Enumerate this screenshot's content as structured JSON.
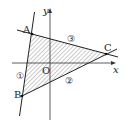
{
  "diagram": {
    "type": "coordinate-geometry",
    "axes": {
      "x_label": "x",
      "y_label": "y",
      "origin_label": "O"
    },
    "points": [
      {
        "label": "A",
        "x": 32,
        "y": 34
      },
      {
        "label": "B",
        "x": 22,
        "y": 96
      },
      {
        "label": "C",
        "x": 106,
        "y": 54
      }
    ],
    "lines": [
      {
        "label": "①",
        "through": [
          "A",
          "B"
        ]
      },
      {
        "label": "②",
        "through": [
          "B",
          "C"
        ]
      },
      {
        "label": "③",
        "through": [
          "A",
          "C"
        ]
      }
    ],
    "region": {
      "shading": "hatched",
      "vertices": [
        "A",
        "B",
        "C"
      ]
    },
    "colors": {
      "line": "#222222",
      "hatch": "#555555",
      "background": "#ffffff"
    }
  }
}
